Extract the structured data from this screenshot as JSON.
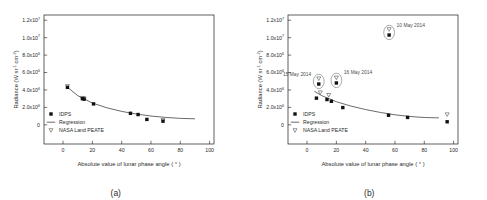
{
  "figure": {
    "panels": [
      {
        "caption": "(a)"
      },
      {
        "caption": "(b)"
      }
    ]
  },
  "axes": {
    "xlabel": "Absolute value of lunar phase angle ( ° )",
    "ylabel": "Radiance (W sr-1 cm-2)",
    "ylabel_parts": {
      "main": "Radiance (W sr",
      "sup1": "-1",
      "mid": " cm",
      "sup2": "-2",
      "end": ")"
    },
    "xticks": [
      "0",
      "20",
      "40",
      "60",
      "80",
      "100"
    ],
    "xtick_values": [
      0,
      20,
      40,
      60,
      80,
      100
    ],
    "xlim": [
      -13,
      103
    ],
    "ylim": [
      -2200000,
      12600000
    ],
    "yticks": [
      "0",
      "2.0x10",
      "4.0x10",
      "6.0x10",
      "8.0x10",
      "1.0x10",
      "1.2x10"
    ],
    "ytick_values": [
      0,
      2000000,
      4000000,
      6000000,
      8000000,
      10000000,
      12000000
    ],
    "ytick_exponents": [
      "",
      "6",
      "6",
      "6",
      "6",
      "7",
      "7"
    ]
  },
  "legend": {
    "items": [
      {
        "label": "IDPS",
        "symbol": "filled-square"
      },
      {
        "label": "Regression",
        "symbol": "line"
      },
      {
        "label": "NASA Land PEATE",
        "symbol": "open-triangle"
      }
    ]
  },
  "chart_data": [
    {
      "type": "scatter",
      "panel": "(a)",
      "title": "",
      "xlabel": "Absolute value of lunar phase angle ( ° )",
      "ylabel": "Radiance (W sr-1 cm-2)",
      "xlim": [
        -13,
        103
      ],
      "ylim": [
        -2200000,
        12600000
      ],
      "grid": false,
      "legend_position": "lower-left",
      "series": [
        {
          "name": "IDPS",
          "marker": "filled-square",
          "x": [
            3.0,
            13.2,
            14.4,
            20.8,
            46.0,
            51.2,
            57.2,
            68.2
          ],
          "y": [
            4300000,
            3000000,
            2950000,
            2400000,
            1320000,
            1180000,
            620000,
            420000
          ]
        },
        {
          "name": "NASA Land PEATE",
          "marker": "open-triangle",
          "x": [
            3.0,
            13.2,
            14.4,
            68.2
          ],
          "y": [
            4420000,
            3060000,
            3010000,
            520000
          ]
        },
        {
          "name": "Regression",
          "marker": "line",
          "x": [
            2.0,
            10,
            20,
            30,
            40,
            50,
            60,
            70,
            80,
            90
          ],
          "y": [
            4450000,
            3350000,
            2500000,
            1950000,
            1540000,
            1240000,
            1010000,
            850000,
            740000,
            690000
          ]
        }
      ]
    },
    {
      "type": "scatter",
      "panel": "(b)",
      "title": "",
      "xlabel": "Absolute value of lunar phase angle ( ° )",
      "ylabel": "Radiance (W sr-1 cm-2)",
      "xlim": [
        -13,
        103
      ],
      "ylim": [
        -2200000,
        12600000
      ],
      "grid": false,
      "legend_position": "lower-left",
      "series": [
        {
          "name": "IDPS",
          "marker": "filled-square",
          "x": [
            6.4,
            13.6,
            16.6,
            24.4,
            55.6,
            68.6,
            95.6,
            8.0,
            20.0,
            56.0
          ],
          "y": [
            3060000,
            2900000,
            2700000,
            1980000,
            1100000,
            850000,
            350000,
            4680000,
            4800000,
            10300000
          ]
        },
        {
          "name": "NASA Land PEATE",
          "marker": "open-triangle",
          "x": [
            9.0,
            14.8,
            95.6,
            8.0,
            20.0,
            56.0
          ],
          "y": [
            3700000,
            3400000,
            1180000,
            5300000,
            5400000,
            10950000
          ]
        },
        {
          "name": "Regression",
          "marker": "line",
          "x": [
            5.0,
            10,
            20,
            30,
            40,
            50,
            60,
            70,
            80,
            90
          ],
          "y": [
            3850000,
            3350000,
            2650000,
            2150000,
            1750000,
            1420000,
            1150000,
            960000,
            840000,
            800000
          ]
        }
      ],
      "annotations": [
        {
          "label": "10 May 2014",
          "x": 56.0,
          "y": 10300000,
          "circled": true
        },
        {
          "label": "15 May 2014",
          "x": 8.0,
          "y": 4680000,
          "circled": true
        },
        {
          "label": "16 May 2014",
          "x": 20.0,
          "y": 4800000,
          "circled": true
        }
      ]
    }
  ]
}
